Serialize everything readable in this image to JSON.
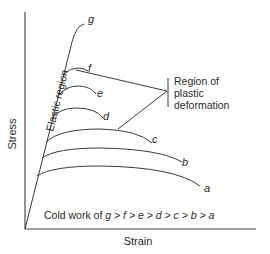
{
  "diagram": {
    "type": "stress-strain curves",
    "axes": {
      "x_label": "Strain",
      "y_label": "Stress"
    },
    "curves": [
      {
        "id": "g",
        "label": "g"
      },
      {
        "id": "f",
        "label": "f"
      },
      {
        "id": "e",
        "label": "e"
      },
      {
        "id": "d",
        "label": "d"
      },
      {
        "id": "c",
        "label": "c"
      },
      {
        "id": "b",
        "label": "b"
      },
      {
        "id": "a",
        "label": "a"
      }
    ],
    "annotations": {
      "elastic_region": "Elastic region",
      "plastic_region": [
        "Region of",
        "plastic",
        "deformation"
      ],
      "cold_work_prefix": "Cold work of ",
      "cold_work_order": "g > f > e > d > c > b > a"
    },
    "colors": {
      "line": "#3a3a3a",
      "text": "#2a2a2a",
      "background": "#ffffff"
    }
  }
}
